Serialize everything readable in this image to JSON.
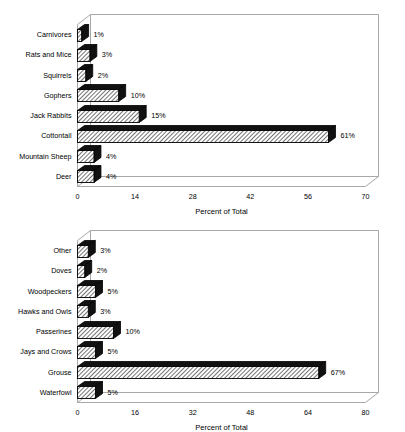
{
  "page": {
    "background_color": "#ffffff",
    "figure_count": 2
  },
  "style": {
    "bar_fill_color": "#ffffff",
    "bar_hatch_color": "#000000",
    "bar_cap_color": "#111111",
    "bar_outline_color": "#000000",
    "frame_color": "#a8a8a8",
    "text_color": "#000000"
  },
  "chart_data": [
    {
      "id": "mammals",
      "type": "bar",
      "orientation": "horizontal",
      "title": "",
      "subtitle": "",
      "xlabel": "Percent of Total",
      "ylabel": "",
      "xlim": [
        0,
        70
      ],
      "xticks": [
        0,
        14,
        28,
        42,
        56,
        70
      ],
      "xtick_labels": [
        "0",
        "14",
        "28",
        "42",
        "56",
        "70"
      ],
      "grid": false,
      "legend": null,
      "value_label_suffix": "%",
      "categories": [
        "Deer",
        "Mountain Sheep",
        "Cottontail",
        "Jack Rabbits",
        "Gophers",
        "Squirrels",
        "Rats and Mice",
        "Carnivores"
      ],
      "values": [
        4,
        4,
        61,
        15,
        10,
        2,
        3,
        1
      ],
      "value_labels": [
        "4%",
        "4%",
        "61%",
        "15%",
        "10%",
        "2%",
        "3%",
        "1%"
      ],
      "bars": [
        {
          "category": "Carnivores",
          "value": 1,
          "label": "1%"
        },
        {
          "category": "Rats and Mice",
          "value": 3,
          "label": "3%"
        },
        {
          "category": "Squirrels",
          "value": 2,
          "label": "2%"
        },
        {
          "category": "Gophers",
          "value": 10,
          "label": "10%"
        },
        {
          "category": "Jack Rabbits",
          "value": 15,
          "label": "15%"
        },
        {
          "category": "Cottontail",
          "value": 61,
          "label": "61%"
        },
        {
          "category": "Mountain Sheep",
          "value": 4,
          "label": "4%"
        },
        {
          "category": "Deer",
          "value": 4,
          "label": "4%"
        }
      ]
    },
    {
      "id": "birds",
      "type": "bar",
      "orientation": "horizontal",
      "title": "",
      "subtitle": "",
      "xlabel": "Percent of Total",
      "ylabel": "",
      "xlim": [
        0,
        80
      ],
      "xticks": [
        0,
        16,
        32,
        48,
        64,
        80
      ],
      "xtick_labels": [
        "0",
        "16",
        "32",
        "48",
        "64",
        "80"
      ],
      "grid": false,
      "legend": null,
      "value_label_suffix": "%",
      "categories": [
        "Waterfowl",
        "Grouse",
        "Jays and Crows",
        "Passerines",
        "Hawks and Owls",
        "Woodpeckers",
        "Doves",
        "Other"
      ],
      "values": [
        5,
        67,
        5,
        10,
        3,
        5,
        2,
        3
      ],
      "value_labels": [
        "5%",
        "67%",
        "5%",
        "10%",
        "3%",
        "5%",
        "2%",
        "3%"
      ],
      "bars": [
        {
          "category": "Other",
          "value": 3,
          "label": "3%"
        },
        {
          "category": "Doves",
          "value": 2,
          "label": "2%"
        },
        {
          "category": "Woodpeckers",
          "value": 5,
          "label": "5%"
        },
        {
          "category": "Hawks and Owls",
          "value": 3,
          "label": "3%"
        },
        {
          "category": "Passerines",
          "value": 10,
          "label": "10%"
        },
        {
          "category": "Jays and Crows",
          "value": 5,
          "label": "5%"
        },
        {
          "category": "Grouse",
          "value": 67,
          "label": "67%"
        },
        {
          "category": "Waterfowl",
          "value": 5,
          "label": "5%"
        }
      ]
    }
  ]
}
